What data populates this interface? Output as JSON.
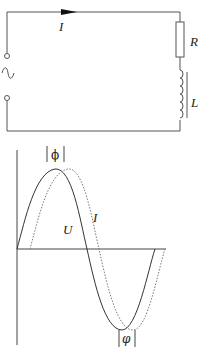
{
  "circuit": {
    "current_label": "I",
    "resistor_label": "R",
    "inductor_label": "L",
    "source": "ac-source",
    "current_direction": "right"
  },
  "waveform": {
    "voltage_label": "U",
    "current_label": "I",
    "phase_label_top": "|ϕ|",
    "phase_label_bottom": "|φ|",
    "voltage_style": "solid",
    "current_style": "dotted",
    "relation": "current lags voltage by phase angle φ"
  }
}
